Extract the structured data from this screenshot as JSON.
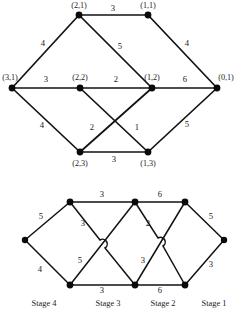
{
  "figure": {
    "title": "",
    "top_graph": {
      "name": "labeled-state-graph",
      "nodes": [
        {
          "id": "n21",
          "label": "(2,1)",
          "x": 79,
          "y": 15,
          "label_x": 79,
          "label_y": 8,
          "anchor": "middle"
        },
        {
          "id": "n11",
          "label": "(1,1)",
          "x": 148,
          "y": 15,
          "label_x": 148,
          "label_y": 8,
          "anchor": "middle"
        },
        {
          "id": "n31",
          "label": "(3,1)",
          "x": 12,
          "y": 88,
          "label_x": 10,
          "label_y": 80,
          "anchor": "middle"
        },
        {
          "id": "n22",
          "label": "(2,2)",
          "x": 80,
          "y": 88,
          "label_x": 80,
          "label_y": 80,
          "anchor": "middle"
        },
        {
          "id": "n12",
          "label": "(1,2)",
          "x": 152,
          "y": 88,
          "label_x": 152,
          "label_y": 80,
          "anchor": "middle"
        },
        {
          "id": "n01",
          "label": "(0,1)",
          "x": 217,
          "y": 88,
          "label_x": 226,
          "label_y": 80,
          "anchor": "middle"
        },
        {
          "id": "n23",
          "label": "(2,3)",
          "x": 80,
          "y": 152,
          "label_x": 80,
          "label_y": 166,
          "anchor": "middle"
        },
        {
          "id": "n13",
          "label": "(1,3)",
          "x": 148,
          "y": 152,
          "label_x": 148,
          "label_y": 166,
          "anchor": "middle"
        }
      ],
      "edges": [
        {
          "from": "n21",
          "to": "n11",
          "weight": "3",
          "wx": 113,
          "wy": 11
        },
        {
          "from": "n31",
          "to": "n21",
          "weight": "4",
          "wx": 43,
          "wy": 46
        },
        {
          "from": "n21",
          "to": "n12",
          "weight": "5",
          "wx": 120,
          "wy": 49
        },
        {
          "from": "n11",
          "to": "n01",
          "weight": "4",
          "wx": 187,
          "wy": 46
        },
        {
          "from": "n31",
          "to": "n22",
          "weight": "3",
          "wx": 46,
          "wy": 82
        },
        {
          "from": "n22",
          "to": "n12",
          "weight": "2",
          "wx": 116,
          "wy": 82
        },
        {
          "from": "n12",
          "to": "n01",
          "weight": "6",
          "wx": 185,
          "wy": 82
        },
        {
          "from": "n31",
          "to": "n23",
          "weight": "4",
          "wx": 42,
          "wy": 128
        },
        {
          "from": "n22",
          "to": "n13",
          "weight": "2",
          "wx": 92,
          "wy": 130
        },
        {
          "from": "n12",
          "to": "n23",
          "weight": "1",
          "wx": 137,
          "wy": 130
        },
        {
          "from": "n13",
          "to": "n01",
          "weight": "5",
          "wx": 187,
          "wy": 127
        },
        {
          "from": "n23",
          "to": "n13",
          "weight": "3",
          "wx": 114,
          "wy": 162
        }
      ]
    },
    "bottom_graph": {
      "name": "trellis-stage-graph",
      "nodes": [
        {
          "id": "b_src",
          "label": "",
          "x": 25,
          "y": 240
        },
        {
          "id": "b_t4",
          "label": "",
          "x": 70,
          "y": 202
        },
        {
          "id": "b_b4",
          "label": "",
          "x": 70,
          "y": 285
        },
        {
          "id": "b_t3",
          "label": "",
          "x": 135,
          "y": 202
        },
        {
          "id": "b_b3",
          "label": "",
          "x": 135,
          "y": 285
        },
        {
          "id": "b_t2",
          "label": "",
          "x": 185,
          "y": 202
        },
        {
          "id": "b_b2",
          "label": "",
          "x": 185,
          "y": 285
        },
        {
          "id": "b_sink",
          "label": "",
          "x": 224,
          "y": 240
        }
      ],
      "edges": [
        {
          "from": "b_src",
          "to": "b_t4",
          "weight": "5",
          "wx": 41,
          "wy": 219
        },
        {
          "from": "b_src",
          "to": "b_b4",
          "weight": "4",
          "wx": 40,
          "wy": 272
        },
        {
          "from": "b_t4",
          "to": "b_t3",
          "weight": "3",
          "wx": 102,
          "wy": 197
        },
        {
          "from": "b_t4",
          "to": "b_b3",
          "weight": "3",
          "wx": 83,
          "wy": 226
        },
        {
          "from": "b_b4",
          "to": "b_t3",
          "weight": "5",
          "wx": 80,
          "wy": 263
        },
        {
          "from": "b_b4",
          "to": "b_b3",
          "weight": "3",
          "wx": 102,
          "wy": 293
        },
        {
          "from": "b_t3",
          "to": "b_t2",
          "weight": "6",
          "wx": 160,
          "wy": 197
        },
        {
          "from": "b_t3",
          "to": "b_b2",
          "weight": "2",
          "wx": 148,
          "wy": 226
        },
        {
          "from": "b_b3",
          "to": "b_t2",
          "weight": "3",
          "wx": 143,
          "wy": 263
        },
        {
          "from": "b_b3",
          "to": "b_b2",
          "weight": "6",
          "wx": 160,
          "wy": 293
        },
        {
          "from": "b_t2",
          "to": "b_sink",
          "weight": "5",
          "wx": 211,
          "wy": 219
        },
        {
          "from": "b_b2",
          "to": "b_sink",
          "weight": "3",
          "wx": 211,
          "wy": 267
        }
      ],
      "stage_labels": [
        {
          "text": "Stage 4",
          "x": 44,
          "y": 306
        },
        {
          "text": "Stage 3",
          "x": 108,
          "y": 306
        },
        {
          "text": "Stage 2",
          "x": 163,
          "y": 306
        },
        {
          "text": "Stage 1",
          "x": 214,
          "y": 306
        }
      ]
    }
  }
}
